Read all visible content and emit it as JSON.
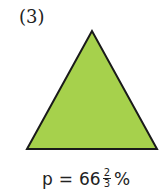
{
  "figure": {
    "label": "(3)",
    "shape": "equilateral-triangle",
    "fill_color": "#a6d14c",
    "stroke_color": "#1a1a1a",
    "caption": {
      "variable": "p",
      "equals": "=",
      "whole": "66",
      "numerator": "2",
      "denominator": "3",
      "unit": "%"
    }
  }
}
